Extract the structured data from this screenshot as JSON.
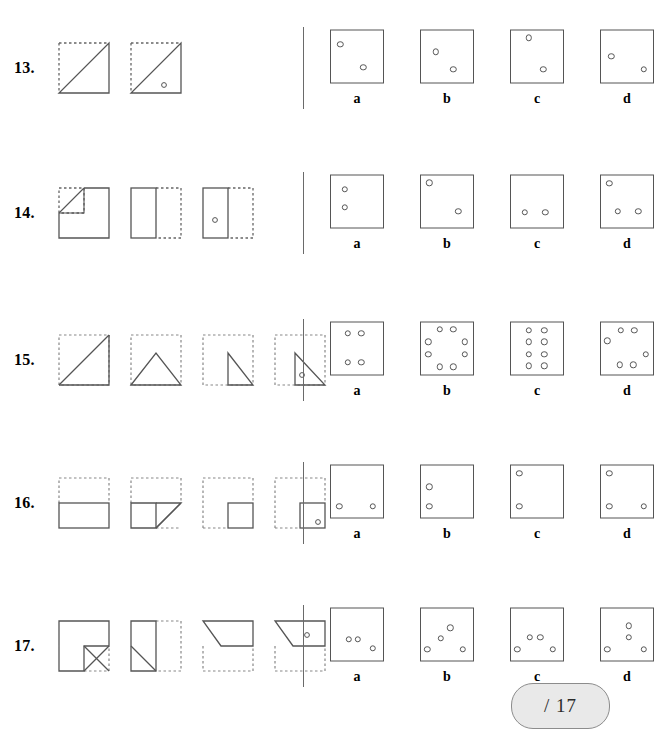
{
  "worksheet": {
    "type": "paper-folding-hole-punch-test",
    "score_box": {
      "label": "/ 17",
      "total": 17
    },
    "option_letters": [
      "a",
      "b",
      "c",
      "d"
    ],
    "questions": [
      {
        "number": "13.",
        "stages": [
          {
            "name": "square-folded-diagonally",
            "description": "square with dashed top and left edges, solid diagonal from bottom-left to top-right, solid bottom and right edges"
          },
          {
            "name": "square-folded-diagonally-with-hole",
            "description": "same triangle shape with one punched hole in lower right region",
            "holes": [
              {
                "x": 62,
                "y": 72
              }
            ]
          }
        ],
        "options": [
          {
            "letter": "a",
            "holes": [
              {
                "x": 18,
                "y": 28
              },
              {
                "x": 62,
                "y": 72
              }
            ]
          },
          {
            "letter": "b",
            "holes": [
              {
                "x": 28,
                "y": 42
              },
              {
                "x": 62,
                "y": 75
              }
            ]
          },
          {
            "letter": "c",
            "holes": [
              {
                "x": 34,
                "y": 15
              },
              {
                "x": 62,
                "y": 75
              }
            ]
          },
          {
            "letter": "d",
            "holes": [
              {
                "x": 20,
                "y": 50
              },
              {
                "x": 82,
                "y": 76
              }
            ]
          }
        ]
      },
      {
        "number": "14.",
        "stages": [
          {
            "name": "square-corner-folded",
            "description": "square with dashed top-left quadrant, small triangle fold at top-left corner"
          },
          {
            "name": "square-folded-in-half-vertically",
            "description": "left half solid rectangle, right half dashed"
          },
          {
            "name": "half-rectangle-with-hole",
            "description": "left half solid rectangle with punched hole, right half dashed",
            "holes": [
              {
                "x": 48,
                "y": 60
              }
            ]
          }
        ],
        "options": [
          {
            "letter": "a",
            "holes": [
              {
                "x": 26,
                "y": 28
              },
              {
                "x": 26,
                "y": 62
              }
            ]
          },
          {
            "letter": "b",
            "holes": [
              {
                "x": 16,
                "y": 15
              },
              {
                "x": 72,
                "y": 70
              }
            ]
          },
          {
            "letter": "c",
            "holes": [
              {
                "x": 26,
                "y": 72
              },
              {
                "x": 66,
                "y": 72
              }
            ]
          },
          {
            "letter": "d",
            "holes": [
              {
                "x": 16,
                "y": 16
              },
              {
                "x": 32,
                "y": 70
              },
              {
                "x": 72,
                "y": 70
              }
            ]
          }
        ]
      },
      {
        "number": "15.",
        "stages": [
          {
            "name": "square-folded-diagonally",
            "description": "dashed square with solid diagonal from bottom-left to top-right"
          },
          {
            "name": "triangle-folded-to-peak",
            "description": "dashed square with solid upward-pointing triangle at bottom"
          },
          {
            "name": "right-triangle-right-side",
            "description": "dashed square with solid right triangle occupying right half"
          },
          {
            "name": "right-triangle-with-hole",
            "description": "dashed square with solid right triangle and one punched hole",
            "holes": [
              {
                "x": 50,
                "y": 70
              }
            ]
          }
        ],
        "options": [
          {
            "letter": "a",
            "holes": [
              {
                "x": 32,
                "y": 22
              },
              {
                "x": 58,
                "y": 22
              },
              {
                "x": 32,
                "y": 78
              },
              {
                "x": 58,
                "y": 78
              }
            ]
          },
          {
            "letter": "b",
            "holes": [
              {
                "x": 36,
                "y": 14
              },
              {
                "x": 62,
                "y": 14
              },
              {
                "x": 14,
                "y": 38
              },
              {
                "x": 84,
                "y": 38
              },
              {
                "x": 14,
                "y": 62
              },
              {
                "x": 84,
                "y": 62
              },
              {
                "x": 36,
                "y": 86
              },
              {
                "x": 62,
                "y": 86
              }
            ]
          },
          {
            "letter": "c",
            "holes": [
              {
                "x": 34,
                "y": 16
              },
              {
                "x": 64,
                "y": 16
              },
              {
                "x": 34,
                "y": 38
              },
              {
                "x": 64,
                "y": 38
              },
              {
                "x": 34,
                "y": 62
              },
              {
                "x": 64,
                "y": 62
              },
              {
                "x": 34,
                "y": 84
              },
              {
                "x": 64,
                "y": 84
              }
            ]
          },
          {
            "letter": "d",
            "holes": [
              {
                "x": 38,
                "y": 16
              },
              {
                "x": 64,
                "y": 16
              },
              {
                "x": 12,
                "y": 36
              },
              {
                "x": 86,
                "y": 62
              },
              {
                "x": 36,
                "y": 82
              },
              {
                "x": 62,
                "y": 82
              }
            ]
          }
        ]
      },
      {
        "number": "16.",
        "stages": [
          {
            "name": "square-folded-in-half-horizontally",
            "description": "dashed square with solid rectangle on bottom half"
          },
          {
            "name": "half-rectangle-corner-fold",
            "description": "dashed square, solid rectangle with diagonal fold at right end"
          },
          {
            "name": "quarter-square",
            "description": "dashed square with small solid square at bottom right of lower half"
          },
          {
            "name": "quarter-square-with-hole",
            "description": "dashed square with small solid square and one punched hole",
            "holes": [
              {
                "x": 76,
                "y": 78
              }
            ]
          }
        ],
        "options": [
          {
            "letter": "a",
            "holes": [
              {
                "x": 16,
                "y": 80
              },
              {
                "x": 80,
                "y": 80
              }
            ]
          },
          {
            "letter": "b",
            "holes": [
              {
                "x": 16,
                "y": 42
              },
              {
                "x": 16,
                "y": 80
              }
            ]
          },
          {
            "letter": "c",
            "holes": [
              {
                "x": 16,
                "y": 16
              },
              {
                "x": 16,
                "y": 80
              }
            ]
          },
          {
            "letter": "d",
            "holes": [
              {
                "x": 16,
                "y": 16
              },
              {
                "x": 16,
                "y": 80
              },
              {
                "x": 82,
                "y": 80
              }
            ]
          }
        ]
      },
      {
        "number": "17.",
        "stages": [
          {
            "name": "square-with-inner-corner-fold",
            "description": "solid square with dashed bottom-right corner and small triangular fold"
          },
          {
            "name": "vertical-half-with-fold",
            "description": "solid tall rectangle on left with diagonal fold, dashed right portion"
          },
          {
            "name": "trapezoid-top-half",
            "description": "solid trapezoid occupying top portion, dashed square outline"
          },
          {
            "name": "trapezoid-with-hole",
            "description": "solid trapezoid with one punched hole, dashed square outline",
            "holes": [
              {
                "x": 62,
                "y": 38
              }
            ]
          }
        ],
        "options": [
          {
            "letter": "a",
            "holes": [
              {
                "x": 34,
                "y": 60
              },
              {
                "x": 52,
                "y": 60
              },
              {
                "x": 80,
                "y": 78
              }
            ]
          },
          {
            "letter": "b",
            "holes": [
              {
                "x": 56,
                "y": 38
              },
              {
                "x": 38,
                "y": 58
              },
              {
                "x": 12,
                "y": 80
              },
              {
                "x": 80,
                "y": 80
              }
            ]
          },
          {
            "letter": "c",
            "holes": [
              {
                "x": 36,
                "y": 56
              },
              {
                "x": 56,
                "y": 56
              },
              {
                "x": 12,
                "y": 80
              },
              {
                "x": 80,
                "y": 80
              }
            ]
          },
          {
            "letter": "d",
            "holes": [
              {
                "x": 54,
                "y": 34
              },
              {
                "x": 54,
                "y": 56
              },
              {
                "x": 12,
                "y": 80
              },
              {
                "x": 82,
                "y": 80
              }
            ]
          }
        ]
      }
    ]
  }
}
